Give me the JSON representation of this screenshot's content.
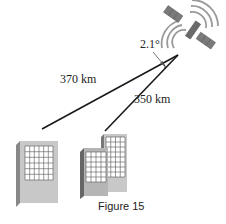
{
  "figure": {
    "caption": "Figure 15",
    "labels": {
      "distance_left": "370 km",
      "distance_right": "350 km",
      "angle": "2.1°"
    },
    "elements": {
      "satellite": "satellite-icon",
      "building_left": "building-icon",
      "building_right": "building-icon"
    },
    "colors": {
      "line": "#1a1a1a",
      "building_face": "#c8c8c8",
      "building_side": "#888888",
      "window": "#ffffff",
      "window_grid": "#555555",
      "satellite_panel": "#7a7a7a",
      "signal_waves": "#9a9a9a"
    }
  }
}
